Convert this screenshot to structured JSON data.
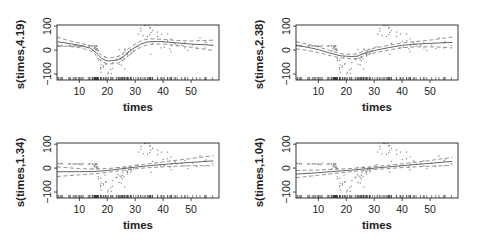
{
  "figure": {
    "layout": "2x2 grid of GAM smooth term plots",
    "background": "#ffffff",
    "colors": {
      "axis": "#222222",
      "fit": "#555555",
      "ci": "#777777",
      "points": "#888888",
      "rug": "#333333"
    }
  },
  "chart_data": [
    {
      "type": "line",
      "title": "",
      "xlabel": "times",
      "ylabel": "s(times,4.19)",
      "xlim": [
        2,
        60
      ],
      "ylim": [
        -125,
        105
      ],
      "xticks": [
        10,
        20,
        30,
        40,
        50
      ],
      "yticks": [
        -100,
        0,
        100
      ],
      "grid": false,
      "legend": "none",
      "series": [
        {
          "name": "fit",
          "style": "solid",
          "x": [
            2,
            6,
            10,
            14,
            16,
            18,
            20,
            22,
            24,
            26,
            28,
            30,
            32,
            34,
            36,
            40,
            45,
            50,
            55,
            58
          ],
          "values": [
            35,
            28,
            20,
            8,
            -10,
            -35,
            -45,
            -44,
            -40,
            -25,
            -5,
            12,
            25,
            33,
            36,
            35,
            30,
            25,
            22,
            20
          ]
        },
        {
          "name": "upper_ci",
          "style": "dashed",
          "x": [
            2,
            6,
            10,
            14,
            16,
            18,
            20,
            22,
            24,
            26,
            28,
            30,
            32,
            34,
            36,
            40,
            45,
            50,
            55,
            58
          ],
          "values": [
            55,
            40,
            30,
            18,
            2,
            -22,
            -32,
            -31,
            -26,
            -10,
            10,
            25,
            38,
            45,
            47,
            45,
            40,
            38,
            40,
            42
          ]
        },
        {
          "name": "lower_ci",
          "style": "dashed",
          "x": [
            2,
            6,
            10,
            14,
            16,
            18,
            20,
            22,
            24,
            26,
            28,
            30,
            32,
            34,
            36,
            40,
            45,
            50,
            55,
            58
          ],
          "values": [
            15,
            16,
            10,
            -2,
            -22,
            -48,
            -58,
            -57,
            -54,
            -40,
            -20,
            -1,
            12,
            21,
            25,
            25,
            20,
            12,
            4,
            -2
          ]
        }
      ]
    },
    {
      "type": "line",
      "title": "",
      "xlabel": "times",
      "ylabel": "s(times,2.38)",
      "xlim": [
        2,
        60
      ],
      "ylim": [
        -125,
        105
      ],
      "xticks": [
        10,
        20,
        30,
        40,
        50
      ],
      "yticks": [
        -100,
        0,
        100
      ],
      "grid": false,
      "legend": "none",
      "series": [
        {
          "name": "fit",
          "style": "solid",
          "x": [
            2,
            6,
            10,
            14,
            18,
            22,
            24,
            26,
            30,
            35,
            40,
            45,
            50,
            55,
            58
          ],
          "values": [
            20,
            12,
            2,
            -12,
            -24,
            -27,
            -25,
            -15,
            -2,
            10,
            20,
            25,
            28,
            31,
            32
          ]
        },
        {
          "name": "upper_ci",
          "style": "dashed",
          "x": [
            2,
            6,
            10,
            14,
            18,
            22,
            24,
            26,
            30,
            35,
            40,
            45,
            50,
            55,
            58
          ],
          "values": [
            35,
            25,
            14,
            -2,
            -15,
            -18,
            -15,
            -5,
            8,
            20,
            30,
            36,
            42,
            50,
            55
          ]
        },
        {
          "name": "lower_ci",
          "style": "dashed",
          "x": [
            2,
            6,
            10,
            14,
            18,
            22,
            24,
            26,
            30,
            35,
            40,
            45,
            50,
            55,
            58
          ],
          "values": [
            5,
            -1,
            -10,
            -22,
            -33,
            -36,
            -35,
            -25,
            -12,
            0,
            10,
            14,
            14,
            12,
            9
          ]
        }
      ]
    },
    {
      "type": "line",
      "title": "",
      "xlabel": "times",
      "ylabel": "s(times,1.34)",
      "xlim": [
        2,
        60
      ],
      "ylim": [
        -125,
        105
      ],
      "xticks": [
        10,
        20,
        30,
        40,
        50
      ],
      "yticks": [
        -100,
        0,
        100
      ],
      "grid": false,
      "legend": "none",
      "series": [
        {
          "name": "fit",
          "style": "solid",
          "x": [
            2,
            10,
            15,
            20,
            25,
            30,
            35,
            40,
            45,
            50,
            58
          ],
          "values": [
            -15,
            -15,
            -14,
            -10,
            -3,
            4,
            10,
            15,
            20,
            24,
            30
          ]
        },
        {
          "name": "upper_ci",
          "style": "dashed",
          "x": [
            2,
            10,
            15,
            20,
            25,
            30,
            35,
            40,
            45,
            50,
            58
          ],
          "values": [
            5,
            -2,
            -4,
            -2,
            4,
            11,
            18,
            26,
            33,
            40,
            52
          ]
        },
        {
          "name": "lower_ci",
          "style": "dashed",
          "x": [
            2,
            10,
            15,
            20,
            25,
            30,
            35,
            40,
            45,
            50,
            58
          ],
          "values": [
            -35,
            -28,
            -24,
            -18,
            -10,
            -3,
            2,
            5,
            8,
            10,
            10
          ]
        }
      ]
    },
    {
      "type": "line",
      "title": "",
      "xlabel": "times",
      "ylabel": "s(times,1.04)",
      "xlim": [
        2,
        60
      ],
      "ylim": [
        -125,
        105
      ],
      "xticks": [
        10,
        20,
        30,
        40,
        50
      ],
      "yticks": [
        -100,
        0,
        100
      ],
      "grid": false,
      "legend": "none",
      "series": [
        {
          "name": "fit",
          "style": "solid",
          "x": [
            2,
            10,
            20,
            30,
            40,
            50,
            58
          ],
          "values": [
            -25,
            -19,
            -10,
            0,
            10,
            20,
            28
          ]
        },
        {
          "name": "upper_ci",
          "style": "dashed",
          "x": [
            2,
            10,
            20,
            30,
            40,
            50,
            58
          ],
          "values": [
            -10,
            -8,
            -3,
            6,
            18,
            32,
            45
          ]
        },
        {
          "name": "lower_ci",
          "style": "dashed",
          "x": [
            2,
            10,
            20,
            30,
            40,
            50,
            58
          ],
          "values": [
            -40,
            -30,
            -17,
            -6,
            2,
            8,
            12
          ]
        }
      ]
    }
  ],
  "observations": {
    "x": [
      2.4,
      2.6,
      3.2,
      3.6,
      4.0,
      6.2,
      6.6,
      6.8,
      7.8,
      8.2,
      8.8,
      8.8,
      9.6,
      10.0,
      10.2,
      10.6,
      11.0,
      11.4,
      13.2,
      13.6,
      13.8,
      14.6,
      14.8,
      14.8,
      15.4,
      15.4,
      15.4,
      15.6,
      15.6,
      15.8,
      15.8,
      16.0,
      16.0,
      16.2,
      16.2,
      16.2,
      16.4,
      16.4,
      16.6,
      16.8,
      16.8,
      16.8,
      17.6,
      17.6,
      17.6,
      17.8,
      17.8,
      18.6,
      18.6,
      19.2,
      19.4,
      19.6,
      20.2,
      20.4,
      21.2,
      21.4,
      21.8,
      22.0,
      23.2,
      23.4,
      24.0,
      24.2,
      24.2,
      24.6,
      25.0,
      25.0,
      25.4,
      25.4,
      25.6,
      26.0,
      26.2,
      26.2,
      26.4,
      27.0,
      27.2,
      27.2,
      27.2,
      27.6,
      28.2,
      28.4,
      28.4,
      28.6,
      29.4,
      30.2,
      31.0,
      31.2,
      32.0,
      32.0,
      32.8,
      33.4,
      33.8,
      34.4,
      34.8,
      35.2,
      35.2,
      35.4,
      35.6,
      35.6,
      36.2,
      36.2,
      38.0,
      38.0,
      39.2,
      39.4,
      40.0,
      40.4,
      41.6,
      41.6,
      42.4,
      42.8,
      42.8,
      43.0,
      44.0,
      44.4,
      45.0,
      46.6,
      47.8,
      47.8,
      48.8,
      50.6,
      52.0,
      53.2,
      55.0,
      55.0,
      55.4,
      57.6
    ],
    "y": [
      0,
      -1.3,
      -2.7,
      0,
      -2.7,
      -2.7,
      -2.7,
      -1.3,
      -2.7,
      -2.7,
      -1.3,
      -2.7,
      -2.7,
      -2.7,
      -5.4,
      -2.7,
      -5.4,
      0,
      -2.7,
      -2.7,
      -1.3,
      -2.7,
      -2.7,
      -22.8,
      -9.3,
      -13.3,
      -13.3,
      -2.7,
      -2.7,
      -6.7,
      -4.5,
      -18.8,
      -16.0,
      -16.0,
      -1.3,
      -5.4,
      -14.3,
      -16.0,
      -21.5,
      -21.5,
      -54.9,
      -64.3,
      -62.2,
      -93.1,
      -99.1,
      -112.5,
      -82.5,
      -85.6,
      -91.5,
      -49.4,
      -78.2,
      -77.5,
      -119.3,
      -112.5,
      -101.9,
      -117.9,
      -96.4,
      -72.2,
      -60.1,
      -57.5,
      -47.5,
      -17.4,
      -79.2,
      -53.6,
      -58.2,
      -82.3,
      -64.5,
      -50.1,
      -37.5,
      -55.5,
      -99.1,
      -15.6,
      -18.8,
      -32.1,
      -45.0,
      -34.5,
      -37.4,
      -26.8,
      -16.4,
      -20.1,
      -36.6,
      -31.2,
      -23.1,
      -8.1,
      -6.2,
      46.9,
      60.0,
      71.4,
      40.2,
      108.5,
      112.7,
      37.5,
      104.9,
      71.4,
      45.0,
      74.4,
      54.1,
      -37.4,
      8.1,
      61.8,
      36.9,
      55.4,
      -10.7,
      46.9,
      16.0,
      -8.1,
      46.9,
      18.8,
      -14.8,
      26.8,
      -26.8,
      -2.7,
      10.7,
      5.4,
      -2.7,
      0,
      -10.7,
      10.7,
      -21.5,
      1.0,
      -13.3,
      30.8,
      -10.7,
      10.7,
      14.7,
      -1.3,
      0,
      10.7
    ]
  }
}
